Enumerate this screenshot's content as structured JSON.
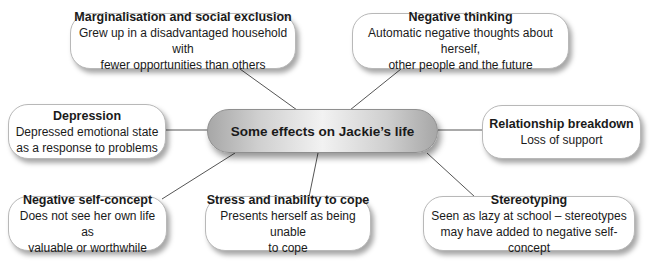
{
  "center": {
    "title": "Some effects on Jackie’s life"
  },
  "nodes": [
    {
      "id": "marginalisation",
      "title": "Marginalisation and social exclusion",
      "description": [
        "Grew up in a disadvantaged household with",
        "fewer opportunities than others"
      ]
    },
    {
      "id": "negative-thinking",
      "title": "Negative thinking",
      "description": [
        "Automatic negative thoughts about herself,",
        "other people and the future"
      ]
    },
    {
      "id": "depression",
      "title": "Depression",
      "description": [
        "Depressed emotional state",
        "as a response to problems"
      ]
    },
    {
      "id": "relationship-breakdown",
      "title": "Relationship breakdown",
      "description": [
        "Loss of support"
      ]
    },
    {
      "id": "negative-self-concept",
      "title": "Negative self-concept",
      "description": [
        "Does not see her own life as",
        "valuable or worthwhile"
      ]
    },
    {
      "id": "stress",
      "title": "Stress and inability to cope",
      "description": [
        "Presents herself as being unable",
        "to cope"
      ]
    },
    {
      "id": "stereotyping",
      "title": "Stereotyping",
      "description": [
        "Seen as lazy at school – stereotypes",
        "may have added to negative self-concept"
      ]
    }
  ],
  "colors": {
    "connector": "#555555",
    "node_border": "#b8b8b8",
    "center_gradient_edge": "#a7a7a7",
    "center_gradient_mid": "#f2f2f2"
  }
}
